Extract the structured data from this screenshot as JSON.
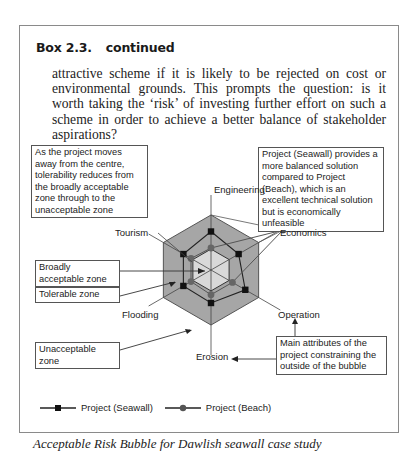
{
  "box": {
    "title_number": "Box 2.3.",
    "title_suffix": "continued",
    "paragraph": "attractive scheme if it is likely to be rejected on cost or environmental grounds. This prompts the question: is it worth taking the ‘risk’ of investing further effort on such a scheme in order to achieve a better balance of stakeholder aspirations?",
    "caption": "Acceptable Risk Bubble for Dawlish seawall case study"
  },
  "annotations": {
    "centre_note": "As the project moves away from the centre, tolerability reduces from the broadly acceptable zone through to the unacceptable zone",
    "seawall_note": "Project (Seawall) provides a more balanced solution compared to Project (Beach), which is an excellent technical solution but is economically unfeasible",
    "broadly_acceptable": "Broadly acceptable zone",
    "tolerable": "Tolerable zone",
    "unacceptable": "Unacceptable zone",
    "main_attributes": "Main attributes of the project constraining the outside of the bubble"
  },
  "chart_data": {
    "type": "radar",
    "title": "Acceptable Risk Bubble for Dawlish seawall case study",
    "axes": [
      "Engineering",
      "Economics",
      "Operation",
      "Erosion",
      "Flooding",
      "Tourism"
    ],
    "scale": [
      0,
      1
    ],
    "zones": [
      {
        "name": "Broadly acceptable zone",
        "outer": 0.38,
        "color": "#d9d9d9"
      },
      {
        "name": "Tolerable zone",
        "outer": 1.0,
        "color": "#a6a6a6"
      },
      {
        "name": "Unacceptable zone",
        "outer": null,
        "color": "#ffffff"
      }
    ],
    "series": [
      {
        "name": "Project (Seawall)",
        "marker": "square",
        "color": "#1a1a1a",
        "values": [
          0.7,
          0.58,
          0.72,
          0.6,
          0.58,
          0.58
        ]
      },
      {
        "name": "Project (Beach)",
        "marker": "circle",
        "color": "#555555",
        "values": [
          0.4,
          1.9,
          0.45,
          0.45,
          0.42,
          0.42
        ]
      }
    ],
    "legend": "bottom-left"
  }
}
